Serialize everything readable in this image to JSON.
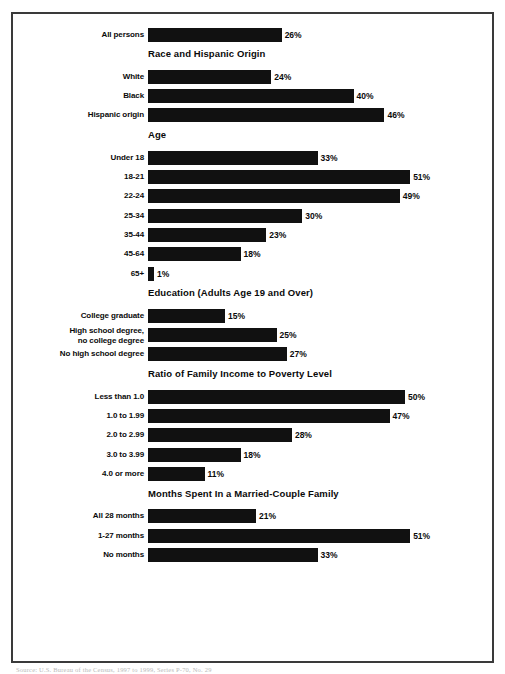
{
  "chart_data": {
    "type": "bar",
    "orientation": "horizontal",
    "title": "",
    "xlabel": "",
    "ylabel": "",
    "xlim": [
      0,
      51
    ],
    "grid": false,
    "legend": false,
    "value_suffix": "%",
    "sections": [
      {
        "heading": "",
        "categories": [
          "All persons"
        ],
        "values": [
          26
        ],
        "labels": [
          "26%"
        ]
      },
      {
        "heading": "Race and Hispanic Origin",
        "categories": [
          "White",
          "Black",
          "Hispanic origin"
        ],
        "values": [
          24,
          40,
          46
        ],
        "labels": [
          "24%",
          "40%",
          "46%"
        ]
      },
      {
        "heading": "Age",
        "categories": [
          "Under 18",
          "18-21",
          "22-24",
          "25-34",
          "35-44",
          "45-64",
          "65+"
        ],
        "values": [
          33,
          51,
          49,
          30,
          23,
          18,
          1
        ],
        "labels": [
          "33%",
          "51%",
          "49%",
          "30%",
          "23%",
          "18%",
          "1%"
        ]
      },
      {
        "heading": "Education (Adults Age 19 and Over)",
        "categories": [
          "College graduate",
          "High school degree,\nno college degree",
          "No high school degree"
        ],
        "values": [
          15,
          25,
          27
        ],
        "labels": [
          "15%",
          "25%",
          "27%"
        ]
      },
      {
        "heading": "Ratio of Family Income to Poverty Level",
        "categories": [
          "Less than 1.0",
          "1.0 to 1.99",
          "2.0 to 2.99",
          "3.0 to 3.99",
          "4.0 or more"
        ],
        "values": [
          50,
          47,
          28,
          18,
          11
        ],
        "labels": [
          "50%",
          "47%",
          "28%",
          "18%",
          "11%"
        ]
      },
      {
        "heading": "Months Spent In a Married-Couple Family",
        "categories": [
          "All 28 months",
          "1-27 months",
          "No months"
        ],
        "values": [
          21,
          51,
          33
        ],
        "labels": [
          "21%",
          "51%",
          "33%"
        ]
      }
    ],
    "colors": {
      "bar": "#111111",
      "text": "#0a0a0a",
      "border": "#3a3a3a",
      "background": "#ffffff"
    }
  },
  "footer": {
    "note": "Source: U.S. Bureau of the Census, 1997 to 1999, Series P-70, No. 29"
  }
}
